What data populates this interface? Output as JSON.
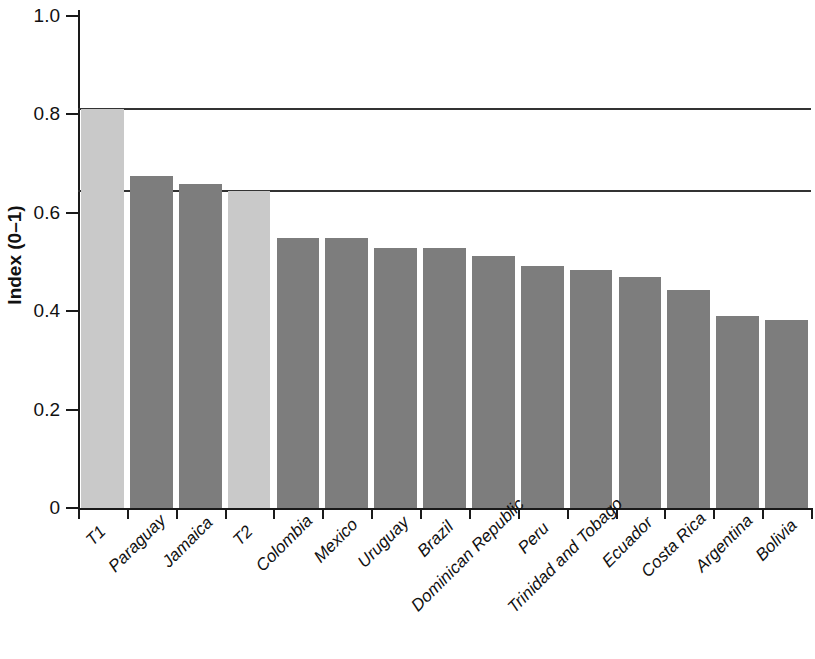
{
  "chart_data": {
    "type": "bar",
    "title": "",
    "subtitle": "",
    "xlabel": "",
    "ylabel": "Index (0–1)",
    "ylim": [
      0,
      1.0
    ],
    "ytick_values": [
      0,
      0.2,
      0.4,
      0.6,
      0.8,
      1.0
    ],
    "ytick_labels": [
      "0",
      "0.2",
      "0.4",
      "0.6",
      "0.8",
      "1.0"
    ],
    "grid": false,
    "legend": null,
    "categories": [
      "T1",
      "Paraguay",
      "Jamaica",
      "T2",
      "Colombia",
      "Mexico",
      "Uruguay",
      "Brazil",
      "Dominican Republic",
      "Peru",
      "Trinidad and Tobago",
      "Ecuador",
      "Costa Rica",
      "Argentina",
      "Bolivia"
    ],
    "values": [
      0.81,
      0.675,
      0.658,
      0.645,
      0.549,
      0.549,
      0.528,
      0.528,
      0.512,
      0.492,
      0.484,
      0.469,
      0.443,
      0.39,
      0.382
    ],
    "bar_colors": [
      "#c9c9c9",
      "#7d7d7d",
      "#7d7d7d",
      "#c9c9c9",
      "#7d7d7d",
      "#7d7d7d",
      "#7d7d7d",
      "#7d7d7d",
      "#7d7d7d",
      "#7d7d7d",
      "#7d7d7d",
      "#7d7d7d",
      "#7d7d7d",
      "#7d7d7d",
      "#7d7d7d"
    ],
    "reference_lines": [
      {
        "label": "T1",
        "value": 0.81,
        "color": "#333333"
      },
      {
        "label": "T2",
        "value": 0.645,
        "color": "#333333"
      }
    ]
  },
  "colors": {
    "benchmark_bar": "#c9c9c9",
    "country_bar": "#7d7d7d",
    "axis": "#1a1a1a",
    "reference_line": "#333333",
    "background": "#ffffff"
  }
}
